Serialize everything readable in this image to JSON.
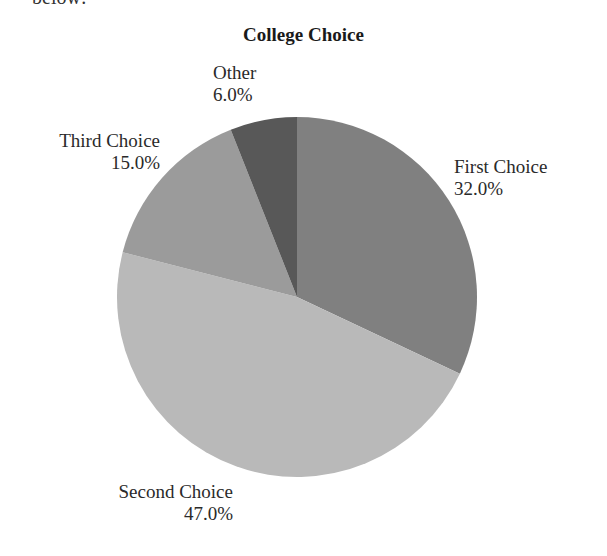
{
  "page": {
    "fragment_text": "below:"
  },
  "chart_data": {
    "type": "pie",
    "title": "College Choice",
    "categories": [
      "First Choice",
      "Second Choice",
      "Third Choice",
      "Other"
    ],
    "values": [
      32.0,
      47.0,
      15.0,
      6.0
    ],
    "value_labels": [
      "32.0%",
      "47.0%",
      "15.0%",
      "6.0%"
    ],
    "colors": [
      "#808080",
      "#b9b9b9",
      "#9b9b9b",
      "#585858"
    ],
    "start_angle": "12 o'clock, clockwise",
    "legend": "none (labels outside slices)"
  }
}
